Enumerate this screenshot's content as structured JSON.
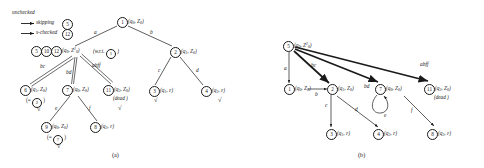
{
  "figure": {
    "caption_a": "(a)",
    "caption_b": "(b)"
  },
  "legend": {
    "title": "unchecked",
    "entries": [
      {
        "label": "skipping",
        "node": "5",
        "arrow": "double"
      },
      {
        "label": "s-checked",
        "node": "12",
        "arrow": "double"
      }
    ]
  },
  "diagram_a": {
    "nodes": {
      "n1": {
        "num": "1",
        "state": "(q",
        "state_sub": "0",
        "state_rest": ", Z",
        "stack_sub": "0",
        "state_end": ")"
      },
      "n2": {
        "num": "2",
        "label_pre": "(q",
        "label_sub": "1",
        "label_mid": ", Z",
        "label_sub2": "0",
        "label_end": ")"
      },
      "n3": {
        "num": "3",
        "label_pre": "(q",
        "label_sub": "1",
        "label_mid": ", ",
        "eps": "ε",
        "label_end": ")"
      },
      "n4": {
        "num": "4",
        "label_pre": "(q",
        "label_sub": "2",
        "label_mid": ", ",
        "eps": "ε",
        "label_end": ")"
      },
      "n5": {
        "num": "5"
      },
      "n10": {
        "num": "10"
      },
      "n12": {
        "num": "12"
      },
      "n6": {
        "num": "6",
        "label_pre": "(q",
        "label_sub": "1",
        "label_mid": ", Z",
        "label_sub2": "0",
        "label_end": ")"
      },
      "n7": {
        "num": "7",
        "label_pre": "(q",
        "label_sub": "0",
        "label_mid": ", Z",
        "label_sub2": "0",
        "label_end": ")"
      },
      "n11": {
        "num": "11",
        "label_pre": "(q",
        "label_sub": "2",
        "label_mid": ", Z",
        "label_sub2": "0",
        "label_end": ")"
      },
      "n9": {
        "num": "9",
        "label_pre": "(q",
        "label_sub": "0",
        "label_mid": ", Z",
        "label_sub2": "0",
        "label_end": ")"
      },
      "n8": {
        "num": "8",
        "label_pre": "(q",
        "label_sub": "2",
        "label_mid": ", ",
        "eps": "ε",
        "label_end": ")"
      }
    },
    "cluster_label": {
      "pre": "(q",
      "sub": "0",
      "mid": ", Z",
      "sup": "2",
      "sub2": "0",
      "end": ")"
    },
    "wrt_note_pre": "(w.r.t. ",
    "wrt_note_num": "1",
    "wrt_note_end": " )",
    "dead_note": "(dead )",
    "eq_n6": {
      "pre": "(= ",
      "num": "2",
      "end": " )"
    },
    "eq_n9": {
      "pre": "(= ",
      "num": "7",
      "end": " )"
    },
    "edges": [
      {
        "from": "1",
        "to": "5-10-12",
        "label": "a"
      },
      {
        "from": "1",
        "to": "2",
        "label": "b"
      },
      {
        "from": "2",
        "to": "3",
        "label": "c"
      },
      {
        "from": "2",
        "to": "4",
        "label": "d"
      },
      {
        "from": "cluster",
        "to": "6",
        "label": "bc",
        "style": "double"
      },
      {
        "from": "cluster",
        "to": "7",
        "label": "bd",
        "style": "double"
      },
      {
        "from": "cluster",
        "to": "11",
        "label": "abff",
        "style": "double"
      },
      {
        "from": "7",
        "to": "9",
        "label": "e"
      },
      {
        "from": "7",
        "to": "8",
        "label": "f"
      }
    ],
    "checkmark": "√",
    "checks_on": [
      "6",
      "11",
      "3",
      "4",
      "9"
    ]
  },
  "diagram_b": {
    "nodes": {
      "n5": {
        "num": "5",
        "label_pre": "(q",
        "label_sub": "0",
        "label_mid": ", Z",
        "label_sup": "2",
        "label_sub2": "0",
        "label_end": ")"
      },
      "n1": {
        "num": "1",
        "label_pre": "(q",
        "label_sub": "0",
        "label_mid": ", Z",
        "label_sub2": "0",
        "label_end": ")"
      },
      "n2": {
        "num": "2",
        "label_pre": "(q",
        "label_sub": "1",
        "label_mid": ", Z",
        "label_sub2": "0",
        "label_end": ")"
      },
      "n7": {
        "num": "7",
        "label_pre": "(q",
        "label_sub": "0",
        "label_mid": ", Z",
        "label_sub2": "0",
        "label_end": ")"
      },
      "n11": {
        "num": "11",
        "label_pre": "(q",
        "label_sub": "2",
        "label_mid": ", Z",
        "label_sub2": "0",
        "label_end": ")"
      },
      "n3": {
        "num": "3",
        "label_pre": "(q",
        "label_sub": "1",
        "label_mid": ", ",
        "eps": "ε",
        "label_end": ")"
      },
      "n4": {
        "num": "4",
        "label_pre": "(q",
        "label_sub": "2",
        "label_mid": ", ",
        "eps": "ε",
        "label_end": ")"
      },
      "n8": {
        "num": "8",
        "label_pre": "(q",
        "label_sub": "2",
        "label_mid": ", ",
        "eps": "ε",
        "label_end": ")"
      }
    },
    "dead_note": "(dead )",
    "edges": [
      {
        "from": "5",
        "to": "1",
        "label": "a",
        "style": "thin"
      },
      {
        "from": "5",
        "to": "2",
        "label": "bc",
        "style": "thick"
      },
      {
        "from": "5",
        "to": "7",
        "label": "bd",
        "style": "thick"
      },
      {
        "from": "5",
        "to": "11",
        "label": "abff",
        "style": "thick"
      },
      {
        "from": "1",
        "to": "2",
        "label": "b",
        "style": "thin"
      },
      {
        "from": "2",
        "to": "3",
        "label": "c",
        "style": "thin"
      },
      {
        "from": "2",
        "to": "4",
        "label": "d",
        "style": "thin"
      },
      {
        "from": "7",
        "to": "7",
        "label": "e",
        "style": "selfloop"
      },
      {
        "from": "7",
        "to": "8",
        "label": "f",
        "style": "thin"
      }
    ]
  }
}
